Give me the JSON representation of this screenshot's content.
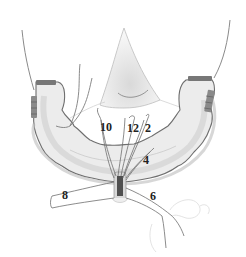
{
  "diagram": {
    "colors": {
      "outline": "#6e6e6e",
      "fill_light": "#efefef",
      "fill_shadow": "#cfcfcf",
      "suture": "#777777",
      "band_dark": "#5a5a5a",
      "label": "#222222"
    },
    "labels": [
      {
        "id": "10",
        "text": "10",
        "x": 100,
        "y": 121
      },
      {
        "id": "12",
        "text": "12",
        "x": 127,
        "y": 122
      },
      {
        "id": "2",
        "text": "2",
        "x": 145,
        "y": 122
      },
      {
        "id": "4",
        "text": "4",
        "x": 143,
        "y": 154
      },
      {
        "id": "8",
        "text": "8",
        "x": 62,
        "y": 189
      },
      {
        "id": "6",
        "text": "6",
        "x": 150,
        "y": 190
      }
    ]
  }
}
